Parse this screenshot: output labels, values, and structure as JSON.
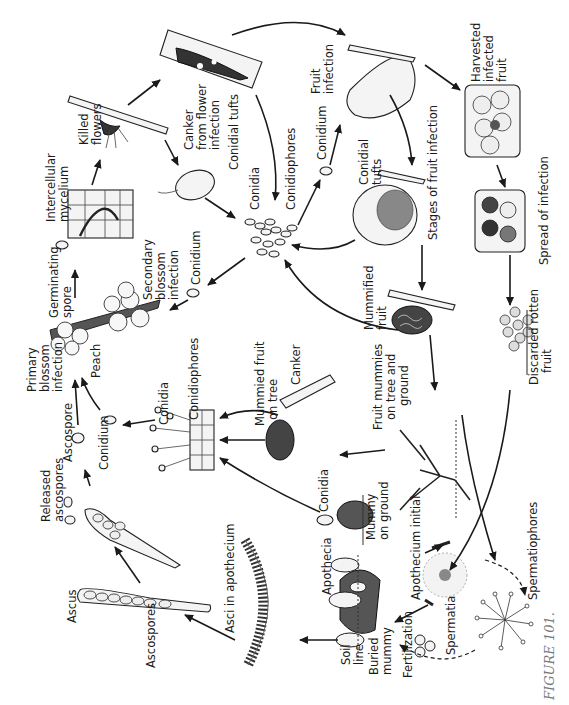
{
  "figure": {
    "caption": "FIGURE 101.",
    "orientation": "rotated 90° counter-clockwise"
  },
  "labels": {
    "killed_flowers": [
      "Killed",
      "flowers"
    ],
    "canker_flower": [
      "Canker",
      "from flower",
      "infection"
    ],
    "conidial_tufts_top": "Conidial  tufts",
    "intercellular_mycelium": [
      "Intercellular",
      "mycelium"
    ],
    "conidia_center": "Conidia",
    "conidiophores_center": "Conidiophores",
    "conidium_top": "Conidium",
    "fruit_infection": [
      "Fruit",
      "infection"
    ],
    "conidial_tufts_fruit": [
      "Conidial",
      "tufts"
    ],
    "stages_fruit_infection": "Stages  of  fruit infection",
    "harvested_infected_fruit": [
      "Harvested",
      "infected",
      "fruit"
    ],
    "spread_of_infection": "Spread of infection",
    "germinating_spore": [
      "Germinating",
      "spore"
    ],
    "secondary_blossom_infection": [
      "Secondary",
      "blossom",
      "infection"
    ],
    "conidium_mid": "Conidium",
    "primary_blossom_infection": [
      "Primary",
      "blossom",
      "infection"
    ],
    "peach": "Peach",
    "mummified_fruit": [
      "Mummified",
      "fruit"
    ],
    "discarded_rotten_fruit": [
      "Discarded  rotten",
      "fruit"
    ],
    "ascospore": "Ascospore",
    "conidium_left": "Conidium",
    "conidia_left": "Conidia",
    "conidiophores_left": "Conidiophores",
    "mummied_fruit_on_tree": [
      "Mummied fruit",
      "on  tree"
    ],
    "canker": "Canker",
    "fruit_mummies": [
      "Fruit mummies",
      "on  tree and",
      "ground"
    ],
    "released_ascospores": [
      "Released",
      "ascospores"
    ],
    "conidia_bottom": "Conidia",
    "mummy_on_ground": [
      "Mummy",
      "on ground"
    ],
    "ascus": "Ascus",
    "ascospores": "Ascospores",
    "asci_in_apothecium": "Asci  in  apothecium",
    "apothecia": "Apothecia",
    "apothecium_initial": "Apothecium  initial",
    "spermatiophores": "Spermatiophores",
    "soil_line": [
      "Soil",
      "line"
    ],
    "buried_mummy": [
      "Buried",
      "mummy"
    ],
    "fertilization": "Fertilization",
    "spermatia": "Spermatia"
  }
}
